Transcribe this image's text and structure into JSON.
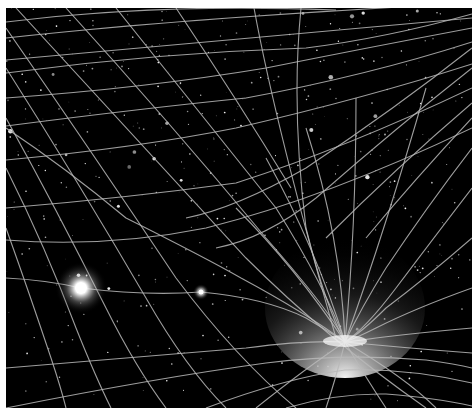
{
  "image": {
    "subject": "spacetime-grid-curvature-illustration",
    "background_color": "#000000",
    "grid_color": "#b8b8b8",
    "frame_color": "#ffffff",
    "bodies": [
      {
        "name": "bright-star",
        "x": 75,
        "y": 280,
        "radius": 22
      },
      {
        "name": "small-star",
        "x": 195,
        "y": 284,
        "radius": 6
      },
      {
        "name": "gravity-well",
        "x": 339,
        "y": 334
      }
    ]
  }
}
